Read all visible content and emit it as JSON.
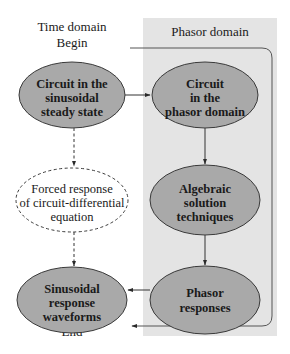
{
  "diagram": {
    "time_domain": {
      "title": "Time domain",
      "begin_label": "Begin",
      "end_label": "End"
    },
    "phasor_domain": {
      "title": "Phasor domain"
    },
    "nodes": {
      "circuit_steady_state": {
        "lines": [
          "Circuit in the",
          "sinusoidal",
          "steady state"
        ]
      },
      "forced_response": {
        "lines": [
          "Forced response",
          "of circuit-differential",
          "equation"
        ]
      },
      "sinusoidal_waveforms": {
        "lines": [
          "Sinusoidal",
          "response",
          "waveforms"
        ]
      },
      "circuit_phasor": {
        "lines": [
          "Circuit",
          "in the",
          "phasor domain"
        ]
      },
      "algebraic": {
        "lines": [
          "Algebraic",
          "solution",
          "techniques"
        ]
      },
      "phasor_responses": {
        "lines": [
          "Phasor",
          "responses"
        ]
      }
    },
    "colors": {
      "node_fill": "#a9a9a9",
      "panel_fill": "#e4e4e4",
      "stroke": "#3a3a3a"
    }
  }
}
